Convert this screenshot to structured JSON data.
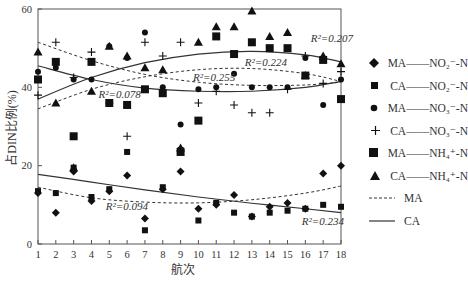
{
  "chart_data": {
    "type": "scatter",
    "title": "",
    "xlabel": "航次",
    "ylabel": "占DIN比例(%)",
    "xlim": [
      1,
      18
    ],
    "ylim": [
      0,
      60
    ],
    "x_ticks": [
      1,
      2,
      3,
      4,
      5,
      6,
      7,
      8,
      9,
      10,
      11,
      12,
      13,
      14,
      15,
      16,
      17,
      18
    ],
    "y_ticks": [
      0,
      20,
      40,
      60
    ],
    "grid": false,
    "legend_position": "right",
    "x": [
      1,
      2,
      3,
      4,
      5,
      6,
      7,
      8,
      9,
      10,
      11,
      12,
      13,
      14,
      15,
      16,
      17,
      18
    ],
    "series": [
      {
        "name": "MA—NO2−-N",
        "marker": "diamond",
        "values": [
          13,
          8,
          18.5,
          11,
          13.5,
          17.5,
          6.5,
          14,
          18.5,
          9,
          10,
          12.5,
          7,
          9.5,
          10.5,
          9,
          18,
          20
        ]
      },
      {
        "name": "CA—NO2−-N",
        "marker": "small-square",
        "values": [
          13.5,
          13,
          19.5,
          12,
          14,
          23.5,
          3.5,
          14.5,
          24,
          6,
          10.5,
          8,
          7,
          8,
          8.5,
          9,
          10,
          9.5
        ]
      },
      {
        "name": "MA—NO3−-N",
        "marker": "circle",
        "values": [
          44,
          45,
          42,
          42,
          50.5,
          47.5,
          54,
          40,
          30.5,
          39.5,
          40,
          43.5,
          40,
          40,
          40,
          47.5,
          35.5,
          42
        ]
      },
      {
        "name": "CA—NO3−-N",
        "marker": "plus",
        "values": [
          38,
          51.5,
          42.5,
          49,
          36,
          27.5,
          51.5,
          48,
          51.5,
          36,
          39,
          35.5,
          33.5,
          33.5,
          39.5,
          48,
          41,
          44
        ]
      },
      {
        "name": "MA—NH4+-N",
        "marker": "square",
        "values": [
          42,
          46.5,
          27.5,
          46.5,
          36,
          35.5,
          39.5,
          38.5,
          23.5,
          31.5,
          53,
          48.5,
          51.5,
          50,
          50,
          43,
          47,
          37
        ]
      },
      {
        "name": "CA—NH4+-N",
        "marker": "triangle",
        "values": [
          49,
          36,
          19.5,
          39,
          50.5,
          48,
          45,
          44.5,
          24.5,
          51.5,
          55.5,
          55.5,
          59.5,
          53,
          54,
          43,
          48,
          46
        ]
      }
    ],
    "trendlines": [
      {
        "group": "MA",
        "style": "dashed",
        "r2": "0.094",
        "points": [
          [
            1,
            14.5
          ],
          [
            4,
            11.8
          ],
          [
            7,
            10.7
          ],
          [
            10,
            10.5
          ],
          [
            13,
            11.3
          ],
          [
            16,
            13
          ],
          [
            18,
            14.8
          ]
        ]
      },
      {
        "group": "CA",
        "style": "solid",
        "r2": "0.234",
        "points": [
          [
            1,
            17.8
          ],
          [
            4,
            15.8
          ],
          [
            7,
            13.8
          ],
          [
            10,
            12
          ],
          [
            13,
            10.4
          ],
          [
            16,
            9
          ],
          [
            18,
            8
          ]
        ]
      },
      {
        "group": "MA",
        "style": "dashed",
        "r2": "0.255",
        "points": [
          [
            1,
            51.5
          ],
          [
            4,
            46.8
          ],
          [
            7,
            43.3
          ],
          [
            10,
            41.3
          ],
          [
            13,
            40.5
          ],
          [
            16,
            40.6
          ],
          [
            18,
            41.3
          ]
        ]
      },
      {
        "group": "MA",
        "style": "dashed",
        "r2": "0.224",
        "points": [
          [
            1,
            34.5
          ],
          [
            4,
            39.5
          ],
          [
            7,
            42.7
          ],
          [
            10,
            44.5
          ],
          [
            13,
            44.8
          ],
          [
            16,
            43.5
          ],
          [
            18,
            41.5
          ]
        ]
      },
      {
        "group": "CA",
        "style": "solid",
        "r2": "0.078",
        "points": [
          [
            1,
            45.5
          ],
          [
            4,
            42
          ],
          [
            7,
            39.8
          ],
          [
            10,
            39
          ],
          [
            13,
            39
          ],
          [
            16,
            40
          ],
          [
            18,
            41.5
          ]
        ]
      },
      {
        "group": "CA",
        "style": "solid",
        "r2": "0.207",
        "points": [
          [
            1,
            37
          ],
          [
            4,
            42.5
          ],
          [
            7,
            46.3
          ],
          [
            10,
            48.5
          ],
          [
            13,
            49.2
          ],
          [
            16,
            48.3
          ],
          [
            18,
            46.5
          ]
        ]
      }
    ],
    "annotations": [
      "R²=0.207",
      "R²=0.224",
      "R²=0.255",
      "R²=0.078",
      "R²=0.094",
      "R²=0.234"
    ]
  },
  "labels": {
    "xlabel": "航次",
    "ylabel": "占DIN比例(%)",
    "r2_labels": [
      {
        "text": "R²=0.207",
        "x": 16.3,
        "y": 51.6
      },
      {
        "text": "R²=0.224",
        "x": 12.6,
        "y": 45.5
      },
      {
        "text": "R²=0.255",
        "x": 9.7,
        "y": 41.7
      },
      {
        "text": "R²=0.078",
        "x": 4.4,
        "y": 37.3
      },
      {
        "text": "R²=0.094",
        "x": 4.8,
        "y": 8.7
      },
      {
        "text": "R²=0.234",
        "x": 15.8,
        "y": 4.8
      }
    ]
  },
  "legend": [
    {
      "key": "ma-no2",
      "marker": "diamond",
      "label": "MA——NO₂⁻-N"
    },
    {
      "key": "ca-no2",
      "marker": "small-square",
      "label": "CA——NO₂⁻-N"
    },
    {
      "key": "ma-no3",
      "marker": "circle",
      "label": "MA——NO₃⁻-N"
    },
    {
      "key": "ca-no3",
      "marker": "plus",
      "label": "CA——NO₃⁻-N"
    },
    {
      "key": "ma-nh4",
      "marker": "square",
      "label": "MA——NH₄⁺-N"
    },
    {
      "key": "ca-nh4",
      "marker": "triangle",
      "label": "CA——NH₄⁺-N"
    },
    {
      "key": "ma-line",
      "marker": "dashed-line",
      "label": "MA"
    },
    {
      "key": "ca-line",
      "marker": "solid-line",
      "label": "CA"
    }
  ],
  "colors": {
    "marker": "#111111",
    "axis": "#555555",
    "text": "#333333"
  }
}
